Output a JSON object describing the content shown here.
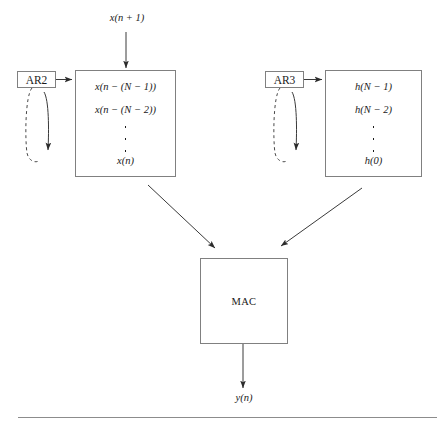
{
  "diagram": {
    "stroke_color": "#808080",
    "line_color": "#3a3a3a",
    "text_color": "#1a1a1a",
    "input_label": "x(n + 1)",
    "output_label": "y(n)",
    "blocks": {
      "ar2": {
        "label": "AR2"
      },
      "ar3": {
        "label": "AR3"
      },
      "mac": {
        "label": "MAC"
      }
    },
    "sample_register": {
      "top": "x(n − (N − 1))",
      "second": "x(n − (N − 2))",
      "ellipsis": "⋮",
      "bottom": "x(n)"
    },
    "coefficient_register": {
      "top": "h(N − 1)",
      "second": "h(N − 2)",
      "ellipsis": "⋮",
      "bottom": "h(0)"
    }
  }
}
